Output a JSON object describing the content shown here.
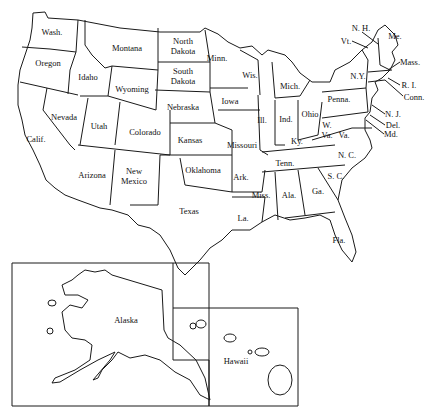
{
  "map": {
    "title": "United States outline map",
    "stroke_color": "#1a1a1a",
    "background": "#ffffff",
    "states": [
      {
        "id": "wash",
        "label": "Wash.",
        "x": 52,
        "y": 32
      },
      {
        "id": "oregon",
        "label": "Oregon",
        "x": 48,
        "y": 63
      },
      {
        "id": "calif",
        "label": "Calif.",
        "x": 36,
        "y": 139
      },
      {
        "id": "nevada",
        "label": "Nevada",
        "x": 64,
        "y": 117
      },
      {
        "id": "idaho",
        "label": "Idaho",
        "x": 88,
        "y": 77
      },
      {
        "id": "montana",
        "label": "Montana",
        "x": 127,
        "y": 48
      },
      {
        "id": "wyoming",
        "label": "Wyoming",
        "x": 132,
        "y": 89
      },
      {
        "id": "utah",
        "label": "Utah",
        "x": 99,
        "y": 126
      },
      {
        "id": "colorado",
        "label": "Colorado",
        "x": 145,
        "y": 132
      },
      {
        "id": "arizona",
        "label": "Arizona",
        "x": 92,
        "y": 175
      },
      {
        "id": "new-mexico",
        "label": "New\nMexico",
        "x": 134,
        "y": 176
      },
      {
        "id": "north-dakota",
        "label": "North\nDakota",
        "x": 183,
        "y": 46
      },
      {
        "id": "south-dakota",
        "label": "South\nDakota",
        "x": 183,
        "y": 76
      },
      {
        "id": "nebraska",
        "label": "Nebraska",
        "x": 183,
        "y": 107
      },
      {
        "id": "kansas",
        "label": "Kansas",
        "x": 190,
        "y": 140
      },
      {
        "id": "oklahoma",
        "label": "Oklahoma",
        "x": 203,
        "y": 170
      },
      {
        "id": "texas",
        "label": "Texas",
        "x": 189,
        "y": 211
      },
      {
        "id": "minn",
        "label": "Minn.",
        "x": 217,
        "y": 58
      },
      {
        "id": "iowa",
        "label": "Iowa",
        "x": 230,
        "y": 101
      },
      {
        "id": "missouri",
        "label": "Missouri",
        "x": 242,
        "y": 145
      },
      {
        "id": "ark",
        "label": "Ark.",
        "x": 241,
        "y": 177
      },
      {
        "id": "la",
        "label": "La.",
        "x": 243,
        "y": 218
      },
      {
        "id": "wis",
        "label": "Wis.",
        "x": 250,
        "y": 75
      },
      {
        "id": "ill",
        "label": "Ill.",
        "x": 262,
        "y": 120
      },
      {
        "id": "mich",
        "label": "Mich.",
        "x": 290,
        "y": 86
      },
      {
        "id": "ind",
        "label": "Ind.",
        "x": 286,
        "y": 119
      },
      {
        "id": "ohio",
        "label": "Ohio",
        "x": 310,
        "y": 114
      },
      {
        "id": "ky",
        "label": "Ky.",
        "x": 297,
        "y": 141
      },
      {
        "id": "tenn",
        "label": "Tenn.",
        "x": 285,
        "y": 163
      },
      {
        "id": "miss",
        "label": "Miss.",
        "x": 261,
        "y": 195
      },
      {
        "id": "ala",
        "label": "Ala.",
        "x": 289,
        "y": 195
      },
      {
        "id": "ga",
        "label": "Ga.",
        "x": 318,
        "y": 191
      },
      {
        "id": "fla",
        "label": "Fla.",
        "x": 339,
        "y": 240
      },
      {
        "id": "sc",
        "label": "S. C.",
        "x": 336,
        "y": 176
      },
      {
        "id": "nc",
        "label": "N. C.",
        "x": 347,
        "y": 155
      },
      {
        "id": "va",
        "label": "Va.",
        "x": 344,
        "y": 135
      },
      {
        "id": "w-va",
        "label": "W.\nVa.",
        "x": 327,
        "y": 130
      },
      {
        "id": "penna",
        "label": "Penna.",
        "x": 339,
        "y": 99
      },
      {
        "id": "ny",
        "label": "N.Y.",
        "x": 358,
        "y": 76
      }
    ],
    "callouts": [
      {
        "id": "nh",
        "label": "N. H.",
        "x": 361,
        "y": 28
      },
      {
        "id": "vt",
        "label": "Vt.",
        "x": 346,
        "y": 41
      },
      {
        "id": "me",
        "label": "Me.",
        "x": 395,
        "y": 36
      },
      {
        "id": "mass",
        "label": "Mass.",
        "x": 410,
        "y": 62
      },
      {
        "id": "ri",
        "label": "R. I.",
        "x": 409,
        "y": 85
      },
      {
        "id": "conn",
        "label": "Conn.",
        "x": 414,
        "y": 97
      },
      {
        "id": "nj",
        "label": "N. J.",
        "x": 393,
        "y": 114
      },
      {
        "id": "del",
        "label": "Del.",
        "x": 393,
        "y": 125
      },
      {
        "id": "md",
        "label": "Md.",
        "x": 391,
        "y": 134
      }
    ],
    "insets": [
      {
        "id": "alaska",
        "label": "Alaska",
        "x": 126,
        "y": 320
      },
      {
        "id": "hawaii",
        "label": "Hawaii",
        "x": 236,
        "y": 361
      }
    ]
  }
}
